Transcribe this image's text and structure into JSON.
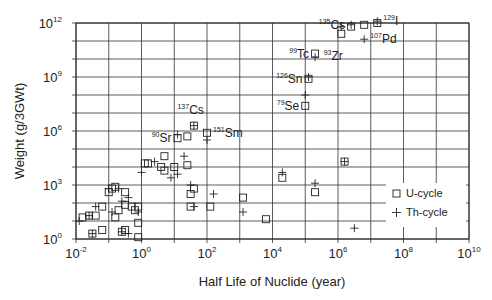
{
  "chart_data": {
    "type": "scatter",
    "title": "",
    "xlabel": "Half Life of Nuclide (year)",
    "ylabel": "Weight (g/3GWt)",
    "xscale": "log",
    "yscale": "log",
    "xlim_exp": [
      -2,
      10
    ],
    "ylim_exp": [
      0,
      12
    ],
    "x_ticks": [
      {
        "base": "10",
        "exp": "-2",
        "value": -2
      },
      {
        "base": "10",
        "exp": "0",
        "value": 0
      },
      {
        "base": "10",
        "exp": "2",
        "value": 2
      },
      {
        "base": "10",
        "exp": "4",
        "value": 4
      },
      {
        "base": "10",
        "exp": "6",
        "value": 6
      },
      {
        "base": "10",
        "exp": "8",
        "value": 8
      },
      {
        "base": "10",
        "exp": "10",
        "value": 10
      }
    ],
    "y_ticks": [
      {
        "base": "10",
        "exp": "0",
        "value": 0
      },
      {
        "base": "10",
        "exp": "3",
        "value": 3
      },
      {
        "base": "10",
        "exp": "6",
        "value": 6
      },
      {
        "base": "10",
        "exp": "9",
        "value": 9
      },
      {
        "base": "10",
        "exp": "12",
        "value": 12
      }
    ],
    "grid": true,
    "legend": {
      "position": "lower right",
      "entries": [
        {
          "marker": "square",
          "label": "U-cycle"
        },
        {
          "marker": "plus",
          "label": "Th-cycle"
        }
      ]
    },
    "series": [
      {
        "name": "U-cycle",
        "marker": "square",
        "points_log10": [
          [
            -1.8,
            1.2
          ],
          [
            -1.6,
            1.3
          ],
          [
            -1.4,
            1.3
          ],
          [
            -1.5,
            0.3
          ],
          [
            -1.2,
            0.5
          ],
          [
            -1.2,
            1.8
          ],
          [
            -1.0,
            2.6
          ],
          [
            -0.9,
            2.8
          ],
          [
            -0.8,
            2.9
          ],
          [
            -0.7,
            1.6
          ],
          [
            -0.8,
            1.2
          ],
          [
            -0.6,
            0.4
          ],
          [
            -0.5,
            0.5
          ],
          [
            -0.5,
            2.6
          ],
          [
            -0.5,
            1.9
          ],
          [
            -0.3,
            1.8
          ],
          [
            -0.2,
            1.6
          ],
          [
            -0.1,
            1.8
          ],
          [
            -0.1,
            0.9
          ],
          [
            -0.1,
            0.1
          ],
          [
            0.1,
            4.2
          ],
          [
            0.2,
            4.2
          ],
          [
            0.6,
            4.0
          ],
          [
            0.7,
            3.8
          ],
          [
            0.7,
            4.6
          ],
          [
            1.0,
            4.0
          ],
          [
            1.4,
            4.1
          ],
          [
            1.5,
            2.5
          ],
          [
            1.5,
            1.8
          ],
          [
            1.6,
            2.8
          ],
          [
            2.1,
            1.8
          ],
          [
            3.1,
            2.3
          ],
          [
            3.8,
            1.1
          ],
          [
            4.3,
            3.4
          ],
          [
            5.3,
            2.6
          ],
          [
            6.2,
            4.3
          ],
          [
            1.1,
            5.6
          ],
          [
            1.4,
            5.7
          ],
          [
            1.6,
            6.3
          ],
          [
            2.0,
            5.9
          ],
          [
            5.0,
            7.4
          ],
          [
            5.1,
            8.9
          ],
          [
            5.3,
            10.3
          ],
          [
            6.1,
            11.4
          ],
          [
            6.4,
            11.8
          ],
          [
            6.8,
            11.9
          ],
          [
            7.2,
            12.0
          ]
        ]
      },
      {
        "name": "Th-cycle",
        "marker": "plus",
        "points_log10": [
          [
            -1.9,
            1.0
          ],
          [
            -1.6,
            1.3
          ],
          [
            -1.4,
            1.8
          ],
          [
            -1.5,
            0.3
          ],
          [
            -1.0,
            2.8
          ],
          [
            -0.9,
            1.5
          ],
          [
            -0.7,
            2.8
          ],
          [
            -0.6,
            2.1
          ],
          [
            -0.4,
            2.3
          ],
          [
            -0.6,
            0.4
          ],
          [
            -0.4,
            0.3
          ],
          [
            -0.1,
            1.5
          ],
          [
            0.0,
            3.7
          ],
          [
            0.4,
            4.3
          ],
          [
            0.9,
            3.4
          ],
          [
            1.1,
            3.6
          ],
          [
            1.3,
            4.6
          ],
          [
            1.5,
            3.0
          ],
          [
            1.6,
            1.8
          ],
          [
            2.2,
            2.5
          ],
          [
            3.1,
            1.5
          ],
          [
            4.3,
            3.7
          ],
          [
            5.3,
            3.1
          ],
          [
            6.2,
            4.3
          ],
          [
            6.5,
            0.6
          ],
          [
            1.1,
            5.8
          ],
          [
            1.6,
            6.3
          ],
          [
            2.0,
            5.5
          ],
          [
            5.0,
            8.0
          ],
          [
            5.1,
            9.0
          ],
          [
            5.3,
            10.1
          ],
          [
            6.1,
            11.8
          ],
          [
            6.4,
            11.9
          ],
          [
            6.8,
            11.1
          ],
          [
            7.2,
            12.1
          ]
        ]
      }
    ],
    "annotations": [
      {
        "mass": "90",
        "element": "Sr",
        "x_log": 1.1,
        "y_log": 5.6,
        "side": "left"
      },
      {
        "mass": "137",
        "element": "Cs",
        "x_log": 1.5,
        "y_log": 6.5,
        "side": "above"
      },
      {
        "mass": "151",
        "element": "Sm",
        "x_log": 2.0,
        "y_log": 5.9,
        "side": "right"
      },
      {
        "mass": "79",
        "element": "Se",
        "x_log": 5.0,
        "y_log": 7.4,
        "side": "left"
      },
      {
        "mass": "126",
        "element": "Sn",
        "x_log": 5.1,
        "y_log": 8.9,
        "side": "left"
      },
      {
        "mass": "99",
        "element": "Tc",
        "x_log": 5.3,
        "y_log": 10.3,
        "side": "left"
      },
      {
        "mass": "93",
        "element": "Zr",
        "x_log": 6.1,
        "y_log": 10.3,
        "side": "below"
      },
      {
        "mass": "135",
        "element": "Cs",
        "x_log": 6.4,
        "y_log": 11.9,
        "side": "left"
      },
      {
        "mass": "107",
        "element": "Pd",
        "x_log": 6.8,
        "y_log": 11.1,
        "side": "right"
      },
      {
        "mass": "129",
        "element": "I",
        "x_log": 7.2,
        "y_log": 12.1,
        "side": "right"
      }
    ]
  },
  "legend": {
    "u_label": "U-cycle",
    "th_label": "Th-cycle"
  },
  "axes": {
    "xlabel": "Half Life of Nuclide (year)",
    "ylabel": "Weight (g/3GWt)"
  }
}
